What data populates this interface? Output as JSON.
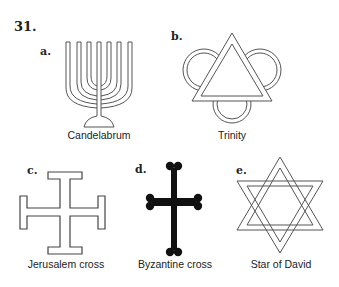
{
  "figure": {
    "number": "31.",
    "items": [
      {
        "letter": "a.",
        "caption": "Candelabrum",
        "icon": "menorah-icon"
      },
      {
        "letter": "b.",
        "caption": "Trinity",
        "icon": "trinity-icon"
      },
      {
        "letter": "c.",
        "caption": "Jerusalem cross",
        "icon": "jerusalem-cross-icon"
      },
      {
        "letter": "d.",
        "caption": "Byzantine cross",
        "icon": "byzantine-cross-icon"
      },
      {
        "letter": "e.",
        "caption": "Star of David",
        "icon": "star-of-david-icon"
      }
    ]
  },
  "colors": {
    "ink": "#222222",
    "background": "#ffffff"
  }
}
